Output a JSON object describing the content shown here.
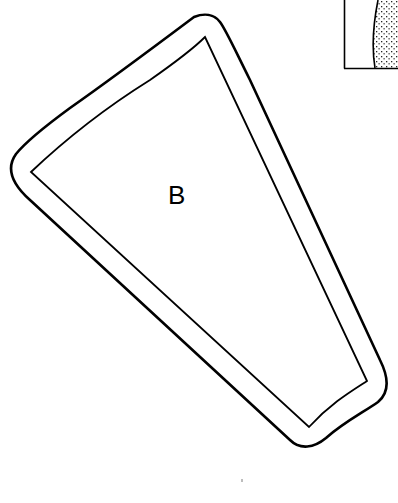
{
  "diagram": {
    "shape_label": "B",
    "colors": {
      "stroke": "#000000",
      "background": "#ffffff",
      "stipple": "#222222"
    },
    "shapes": [
      {
        "name": "outer-outline",
        "kind": "rounded-quadrilateral"
      },
      {
        "name": "inner-outline",
        "kind": "quadrilateral"
      },
      {
        "name": "inset-panel",
        "kind": "rectangle-with-stippled-region"
      }
    ]
  }
}
